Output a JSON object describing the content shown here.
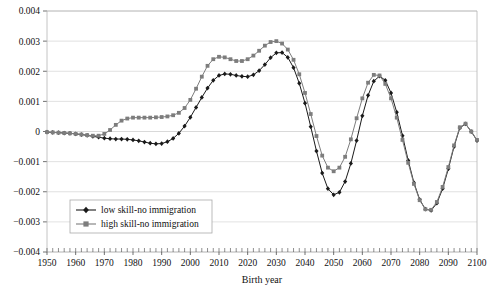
{
  "chart_data": {
    "type": "line",
    "title": "",
    "xlabel": "Birth year",
    "ylabel": "",
    "xlim": [
      1950,
      2100
    ],
    "ylim": [
      -0.004,
      0.004
    ],
    "grid": true,
    "legend_position": "lower-left-inside",
    "xticks": [
      1950,
      1960,
      1970,
      1980,
      1990,
      2000,
      2010,
      2020,
      2030,
      2040,
      2050,
      2060,
      2070,
      2080,
      2090,
      2100
    ],
    "xtick_labels": [
      "1950",
      "1960",
      "1970",
      "1980",
      "1990",
      "2000",
      "2010",
      "2020",
      "2030",
      "2040",
      "2050",
      "2060",
      "2070",
      "2080",
      "2090",
      "2100"
    ],
    "yticks": [
      -0.004,
      -0.003,
      -0.002,
      -0.001,
      0,
      0.001,
      0.002,
      0.003,
      0.004
    ],
    "ytick_labels": [
      "-0.004",
      "-0.003",
      "-0.002",
      "-0.001",
      "0",
      "0.001",
      "0.002",
      "0.003",
      "0.004"
    ],
    "minor_xtick_step": 2,
    "x": [
      1950,
      1952,
      1954,
      1956,
      1958,
      1960,
      1962,
      1964,
      1966,
      1968,
      1970,
      1972,
      1974,
      1976,
      1978,
      1980,
      1982,
      1984,
      1986,
      1988,
      1990,
      1992,
      1994,
      1996,
      1998,
      2000,
      2002,
      2004,
      2006,
      2008,
      2010,
      2012,
      2014,
      2016,
      2018,
      2020,
      2022,
      2024,
      2026,
      2028,
      2030,
      2032,
      2034,
      2036,
      2038,
      2040,
      2042,
      2044,
      2046,
      2048,
      2050,
      2052,
      2054,
      2056,
      2058,
      2060,
      2062,
      2064,
      2066,
      2068,
      2070,
      2072,
      2074,
      2076,
      2078,
      2080,
      2082,
      2084,
      2086,
      2088,
      2090,
      2092,
      2094,
      2096,
      2098,
      2100
    ],
    "series": [
      {
        "name": "low skill-no immigration",
        "color": "#1a1a1a",
        "marker": "diamond",
        "values": [
          -2e-05,
          -3e-05,
          -4e-05,
          -5e-05,
          -6e-05,
          -8e-05,
          -0.0001,
          -0.00013,
          -0.00016,
          -0.00019,
          -0.00022,
          -0.00024,
          -0.00025,
          -0.00025,
          -0.00026,
          -0.00028,
          -0.00031,
          -0.00035,
          -0.00039,
          -0.00041,
          -0.0004,
          -0.00034,
          -0.00023,
          -6e-05,
          0.00018,
          0.00047,
          0.0008,
          0.00113,
          0.00144,
          0.0017,
          0.00186,
          0.00191,
          0.0019,
          0.00186,
          0.00183,
          0.00182,
          0.00188,
          0.00202,
          0.00222,
          0.00245,
          0.00261,
          0.00262,
          0.00246,
          0.00212,
          0.0016,
          0.00094,
          0.00016,
          -0.00065,
          -0.00138,
          -0.0019,
          -0.0021,
          -0.00202,
          -0.00166,
          -0.00106,
          -0.0003,
          0.00052,
          0.0012,
          0.00167,
          0.00184,
          0.0017,
          0.00128,
          0.00064,
          -0.00014,
          -0.00096,
          -0.0017,
          -0.00226,
          -0.00258,
          -0.00262,
          -0.00238,
          -0.0019,
          -0.00124,
          -0.0005,
          0.00012,
          0.00025,
          0.0,
          -0.0003
        ]
      },
      {
        "name": "high skill-no immigration",
        "color": "#7d7d7d",
        "marker": "square",
        "values": [
          -2e-05,
          -3e-05,
          -4e-05,
          -5e-05,
          -6e-05,
          -8e-05,
          -0.0001,
          -0.00012,
          -0.00014,
          -0.00014,
          -8e-05,
          5e-05,
          0.00022,
          0.00036,
          0.00043,
          0.00046,
          0.00046,
          0.00046,
          0.00046,
          0.00047,
          0.00048,
          0.0005,
          0.00054,
          0.00062,
          0.00078,
          0.00105,
          0.00142,
          0.00182,
          0.00218,
          0.0024,
          0.00248,
          0.00246,
          0.0024,
          0.00234,
          0.00234,
          0.0024,
          0.00252,
          0.00268,
          0.00285,
          0.00297,
          0.003,
          0.00292,
          0.00272,
          0.00238,
          0.0019,
          0.00128,
          0.00058,
          -0.00015,
          -0.0008,
          -0.0012,
          -0.00132,
          -0.0012,
          -0.00084,
          -0.00026,
          0.00044,
          0.0011,
          0.00162,
          0.00188,
          0.00186,
          0.00158,
          0.0011,
          0.00046,
          -0.00028,
          -0.00104,
          -0.00174,
          -0.00228,
          -0.00258,
          -0.0026,
          -0.00234,
          -0.00184,
          -0.00118,
          -0.00046,
          0.00014,
          0.00026,
          0.0,
          -0.00028
        ]
      }
    ]
  },
  "legend": {
    "entries": [
      {
        "label": "low skill-no immigration"
      },
      {
        "label": "high skill-no immigration"
      }
    ]
  }
}
